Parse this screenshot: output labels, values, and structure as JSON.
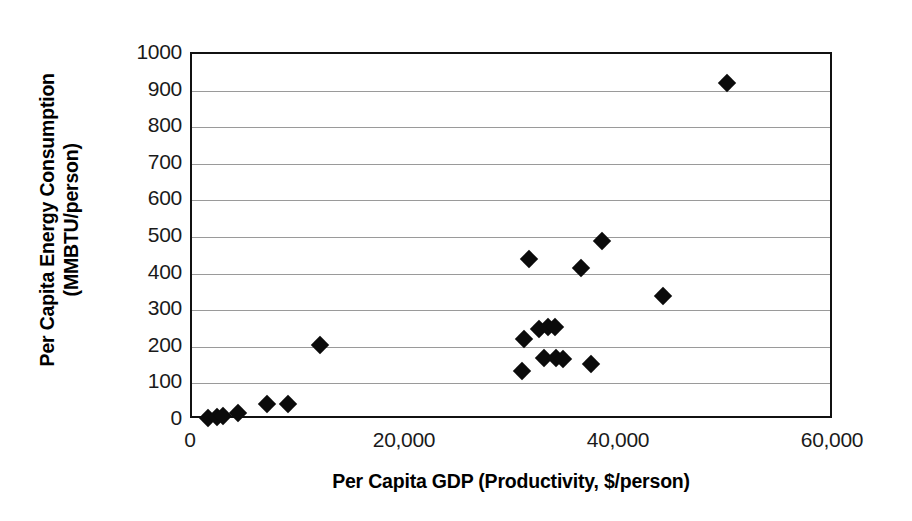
{
  "chart_data": {
    "type": "scatter",
    "title": "",
    "xlabel": "Per Capita GDP (Productivity, $/person)",
    "ylabel": "Per Capita Energy Consumption (MMBTU/person)",
    "ylabel_line1": "Per Capita Energy Consumption",
    "ylabel_line2": "(MMBTU/person)",
    "xlim": [
      0,
      60000
    ],
    "ylim": [
      0,
      1000
    ],
    "xticks": [
      0,
      20000,
      40000,
      60000
    ],
    "xtick_labels": [
      "0",
      "20,000",
      "40,000",
      "60,000"
    ],
    "yticks": [
      0,
      100,
      200,
      300,
      400,
      500,
      600,
      700,
      800,
      900,
      1000
    ],
    "ytick_labels": [
      "0",
      "100",
      "200",
      "300",
      "400",
      "500",
      "600",
      "700",
      "800",
      "900",
      "1000"
    ],
    "grid": "horizontal",
    "grid_color": "#9a9a9a",
    "legend": "none",
    "marker": "filled-diamond",
    "marker_color": "#0b0b0b",
    "series": [
      {
        "name": "Countries",
        "points": [
          {
            "x": 1500,
            "y": 5
          },
          {
            "x": 2300,
            "y": 8
          },
          {
            "x": 2900,
            "y": 10
          },
          {
            "x": 4300,
            "y": 20
          },
          {
            "x": 7000,
            "y": 45
          },
          {
            "x": 9000,
            "y": 45
          },
          {
            "x": 12000,
            "y": 205
          },
          {
            "x": 30800,
            "y": 135
          },
          {
            "x": 31000,
            "y": 220
          },
          {
            "x": 31500,
            "y": 440
          },
          {
            "x": 32400,
            "y": 250
          },
          {
            "x": 32900,
            "y": 170
          },
          {
            "x": 33300,
            "y": 255
          },
          {
            "x": 33900,
            "y": 253
          },
          {
            "x": 34000,
            "y": 170
          },
          {
            "x": 34700,
            "y": 168
          },
          {
            "x": 36400,
            "y": 415
          },
          {
            "x": 37300,
            "y": 152
          },
          {
            "x": 38300,
            "y": 490
          },
          {
            "x": 44000,
            "y": 340
          },
          {
            "x": 50000,
            "y": 920
          }
        ]
      }
    ]
  }
}
